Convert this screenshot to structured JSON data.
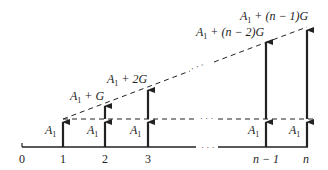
{
  "diagram": {
    "type": "cash-flow-diagram",
    "axis": {
      "ticks": [
        {
          "label": "0",
          "x": 22
        },
        {
          "label": "1",
          "x": 63
        },
        {
          "label": "2",
          "x": 105
        },
        {
          "label": "3",
          "x": 148
        },
        {
          "label": "n − 1",
          "x": 266
        },
        {
          "label": "n",
          "x": 307
        }
      ],
      "gap_ellipsis": "· · ·"
    },
    "base_amount_label": "A1",
    "arrows": [
      {
        "period": "1",
        "base": "A1",
        "top_label": "",
        "top_y": 119
      },
      {
        "period": "2",
        "base": "A1",
        "top_label": "A1 + G",
        "top_y": 103
      },
      {
        "period": "3",
        "base": "A1",
        "top_label": "A1 + 2G",
        "top_y": 87
      },
      {
        "period": "n − 1",
        "base": "A1",
        "top_label": "A1 + (n − 2)G",
        "top_y": 39
      },
      {
        "period": "n",
        "base": "A1",
        "top_label": "A1 + (n − 1)G",
        "top_y": 27
      }
    ],
    "labels": {
      "tick0": "0",
      "tick1": "1",
      "tick2": "2",
      "tick3": "3",
      "tickn1": "n − 1",
      "tickn": "n",
      "A": "A",
      "sub1": "1",
      "top2_rest": " + G",
      "top3_rest": " + 2G",
      "topn1_rest": " + (n − 2)G",
      "topn_rest": " + (n − 1)G",
      "dots": "· · ·"
    },
    "colors": {
      "ink": "#222222",
      "background": "#ffffff"
    }
  }
}
